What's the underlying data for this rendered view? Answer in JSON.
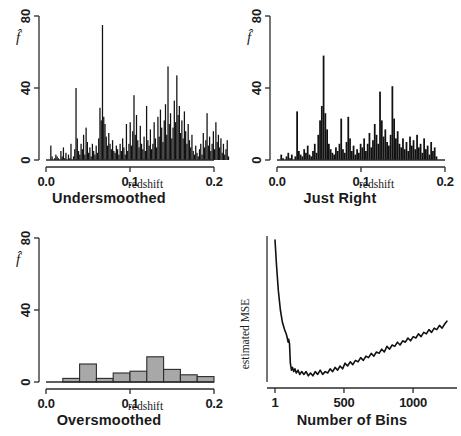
{
  "figure": {
    "width": 461,
    "height": 436,
    "background": "#ffffff",
    "ink_color": "#111111",
    "gray_fill": "#a8a8a8"
  },
  "chart_data": [
    {
      "type": "bar",
      "panel_id": "undersmoothed",
      "title": "Undersmoothed",
      "xlabel": "redshift",
      "ylabel": "f̂",
      "xlim": [
        0.0,
        0.2
      ],
      "ylim": [
        0,
        80
      ],
      "xticks": [
        0.0,
        0.1,
        0.2
      ],
      "xticklabels": [
        "0.0",
        "0.1",
        "0.2"
      ],
      "yticks": [
        0,
        40,
        80
      ],
      "yticklabels": [
        "0",
        "40",
        "80"
      ],
      "grid": false,
      "legend": "none",
      "bin_width": 0.0015,
      "bar_style": "solid-black",
      "x_start": 0.005,
      "values": [
        8,
        2,
        0,
        1,
        3,
        2,
        1,
        0,
        5,
        2,
        7,
        1,
        4,
        0,
        3,
        1,
        9,
        0,
        2,
        6,
        40,
        12,
        5,
        3,
        9,
        6,
        14,
        3,
        18,
        10,
        4,
        7,
        2,
        9,
        5,
        3,
        8,
        4,
        12,
        29,
        22,
        75,
        24,
        20,
        13,
        8,
        15,
        9,
        6,
        11,
        5,
        4,
        8,
        6,
        3,
        9,
        5,
        12,
        7,
        3,
        20,
        5,
        9,
        21,
        8,
        16,
        36,
        14,
        25,
        11,
        7,
        19,
        9,
        6,
        13,
        5,
        30,
        11,
        8,
        17,
        6,
        9,
        21,
        12,
        7,
        24,
        13,
        28,
        18,
        10,
        22,
        31,
        14,
        52,
        20,
        26,
        12,
        18,
        33,
        21,
        47,
        25,
        30,
        15,
        22,
        12,
        27,
        16,
        9,
        20,
        11,
        7,
        14,
        5,
        3,
        8,
        4,
        2,
        6,
        9,
        3,
        15,
        7,
        11,
        26,
        8,
        13,
        5,
        9,
        16,
        6,
        21,
        10,
        14,
        7,
        12,
        4,
        9,
        3,
        6,
        11,
        2
      ]
    },
    {
      "type": "bar",
      "panel_id": "just-right",
      "title": "Just Right",
      "xlabel": "redshift",
      "ylabel": "f̂",
      "xlim": [
        0.0,
        0.2
      ],
      "ylim": [
        0,
        80
      ],
      "xticks": [
        0.0,
        0.1,
        0.2
      ],
      "xticklabels": [
        "0.0",
        "0.1",
        "0.2"
      ],
      "yticks": [
        0,
        40,
        80
      ],
      "yticklabels": [
        "0",
        "40",
        "80"
      ],
      "grid": false,
      "legend": "none",
      "bin_width": 0.0021,
      "bar_style": "solid-black",
      "x_start": 0.004,
      "values": [
        3,
        1,
        0,
        2,
        4,
        1,
        3,
        0,
        2,
        27,
        5,
        3,
        2,
        6,
        4,
        8,
        3,
        2,
        5,
        9,
        4,
        14,
        22,
        30,
        58,
        26,
        17,
        9,
        6,
        4,
        3,
        7,
        5,
        9,
        23,
        6,
        4,
        10,
        24,
        12,
        5,
        8,
        3,
        6,
        4,
        9,
        7,
        12,
        5,
        9,
        15,
        7,
        11,
        20,
        14,
        9,
        38,
        22,
        13,
        17,
        10,
        8,
        14,
        41,
        23,
        12,
        16,
        9,
        7,
        12,
        6,
        10,
        5,
        13,
        8,
        11,
        6,
        14,
        7,
        9,
        4,
        12,
        6,
        8,
        3,
        10,
        5,
        7,
        2
      ]
    },
    {
      "type": "bar",
      "panel_id": "oversmoothed",
      "title": "Oversmoothed",
      "xlabel": "redshift",
      "ylabel": "f̂",
      "xlim": [
        0.0,
        0.2
      ],
      "ylim": [
        0,
        80
      ],
      "xticks": [
        0.0,
        0.1,
        0.2
      ],
      "xticklabels": [
        "0.0",
        "0.1",
        "0.2"
      ],
      "yticks": [
        0,
        40,
        80
      ],
      "yticklabels": [
        "0",
        "40",
        "80"
      ],
      "grid": false,
      "legend": "none",
      "bin_width": 0.02,
      "bar_style": "gray-filled-outlined",
      "x_start": 0.02,
      "values": [
        2,
        10,
        2,
        5,
        6,
        14,
        7,
        4,
        3
      ]
    },
    {
      "type": "line",
      "panel_id": "mse",
      "title": "Number of Bins",
      "xlabel": "Number of Bins",
      "ylabel": "estimated MSE",
      "xticks": [
        1,
        500,
        1000
      ],
      "xticklabels": [
        "1",
        "500",
        "1000"
      ],
      "yticks": [],
      "yticklabels": [],
      "grid": false,
      "legend": "none",
      "xlim": [
        1,
        1260
      ],
      "x": [
        1,
        12,
        25,
        40,
        55,
        70,
        82,
        90,
        96,
        100,
        106,
        112,
        120,
        128,
        136,
        145,
        155,
        168,
        180,
        195,
        210,
        226,
        242,
        258,
        275,
        292,
        310,
        328,
        346,
        364,
        382,
        400,
        418,
        436,
        454,
        472,
        490,
        508,
        526,
        545,
        564,
        583,
        602,
        621,
        640,
        659,
        678,
        697,
        716,
        735,
        754,
        773,
        792,
        811,
        830,
        849,
        868,
        887,
        906,
        925,
        944,
        963,
        982,
        1001,
        1020,
        1039,
        1058,
        1077,
        1096,
        1115,
        1134,
        1153,
        1172,
        1191,
        1210,
        1229,
        1245
      ],
      "y": [
        100,
        82,
        64,
        50,
        41,
        36,
        33,
        30,
        27,
        29,
        26,
        12,
        7,
        9,
        6,
        8,
        5,
        7,
        4,
        6,
        4,
        6,
        3,
        5,
        3,
        6,
        4,
        7,
        4,
        6,
        5,
        8,
        6,
        9,
        7,
        10,
        8,
        12,
        10,
        13,
        11,
        14,
        13,
        16,
        14,
        17,
        16,
        19,
        17,
        20,
        19,
        22,
        20,
        24,
        22,
        25,
        24,
        27,
        25,
        28,
        27,
        30,
        28,
        31,
        30,
        33,
        31,
        34,
        33,
        36,
        34,
        37,
        36,
        39,
        37,
        40,
        42
      ]
    }
  ]
}
